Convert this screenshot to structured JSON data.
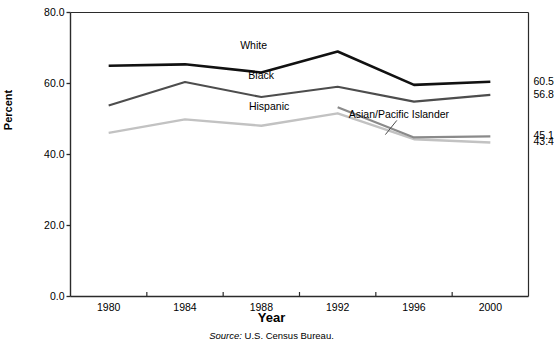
{
  "chart_data": {
    "type": "line",
    "title": "",
    "xlabel": "Year",
    "ylabel": "Percent",
    "categories": [
      "1980",
      "1984",
      "1988",
      "1992",
      "1996",
      "2000"
    ],
    "x": [
      1980,
      1984,
      1988,
      1992,
      1996,
      2000
    ],
    "xlim": [
      1978,
      2002
    ],
    "ylim": [
      0.0,
      80.0
    ],
    "yticks": [
      "0.0",
      "20.0",
      "40.0",
      "60.0",
      "80.0"
    ],
    "ytick_values": [
      0.0,
      20.0,
      40.0,
      60.0,
      80.0
    ],
    "grid": false,
    "legend_position": "inline-annotations",
    "series": [
      {
        "name": "White",
        "color": "#111111",
        "values": [
          65.0,
          65.4,
          63.1,
          69.0,
          59.6,
          60.5
        ],
        "end_label": "60.5",
        "label_x": 1987.6,
        "label_y": 70.6
      },
      {
        "name": "Black",
        "color": "#4d4d4d",
        "values": [
          53.8,
          60.4,
          56.2,
          59.1,
          54.9,
          56.8
        ],
        "end_label": "56.8",
        "label_x": 1988.0,
        "label_y": 62.2
      },
      {
        "name": "Hispanic",
        "color": "#c2c2c2",
        "values": [
          46.1,
          49.9,
          48.1,
          51.6,
          44.3,
          43.4
        ],
        "end_label": "43.4",
        "label_x": 1988.4,
        "label_y": 53.4
      },
      {
        "name": "Asian/Pacific Islander",
        "color": "#8a8a8a",
        "values": [
          null,
          null,
          null,
          53.3,
          44.8,
          45.1
        ],
        "end_label": "45.1",
        "label_x": 1995.2,
        "label_y": 51.2
      }
    ],
    "annotations": [
      {
        "text": "Source: U.S. Census Bureau.",
        "keyword": "Source:",
        "rest": " U.S. Census Bureau."
      }
    ]
  },
  "axes": {
    "y_axis_title": "Percent",
    "x_axis_title": "Year"
  }
}
